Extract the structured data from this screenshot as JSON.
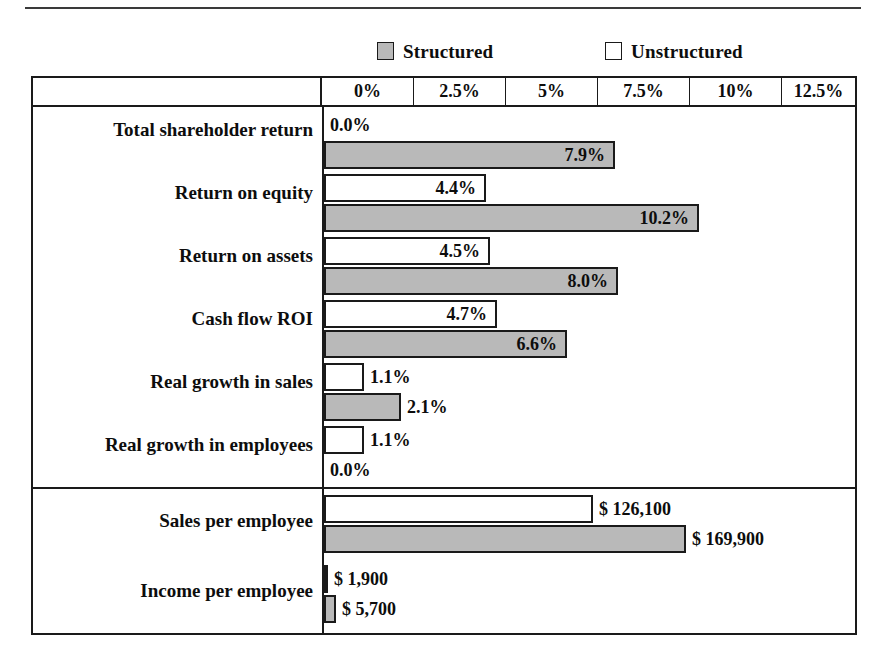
{
  "legend": {
    "items": [
      {
        "label": "Structured",
        "swatch": "gray-filled-square-icon",
        "color": "#b9b9b9"
      },
      {
        "label": "Unstructured",
        "swatch": "white-empty-square-icon",
        "color": "#ffffff"
      }
    ]
  },
  "axis": {
    "ticks": [
      "0%",
      "2.5%",
      "5%",
      "7.5%",
      "10%",
      "12.5%"
    ],
    "min": 0,
    "max": 12.5,
    "step": 2.5
  },
  "chart_data": {
    "type": "bar",
    "title": "",
    "subtitle": "",
    "xlabel": "",
    "ylabel": "",
    "orientation": "horizontal",
    "grid": false,
    "legend_position": "top",
    "series": [
      {
        "name": "Unstructured",
        "color": "#ffffff"
      },
      {
        "name": "Structured",
        "color": "#b9b9b9"
      }
    ],
    "panels": [
      {
        "name": "percent-metrics",
        "axis_ticks": [
          "0%",
          "2.5%",
          "5%",
          "7.5%",
          "10%",
          "12.5%"
        ],
        "xlim": [
          0,
          12.5
        ],
        "rows": [
          {
            "category": "Total shareholder return",
            "unstructured": {
              "value": 0.0,
              "label": "0.0%",
              "label_position": "no-bar"
            },
            "structured": {
              "value": 7.9,
              "label": "7.9%",
              "label_position": "inside"
            }
          },
          {
            "category": "Return on equity",
            "unstructured": {
              "value": 4.4,
              "label": "4.4%",
              "label_position": "inside"
            },
            "structured": {
              "value": 10.2,
              "label": "10.2%",
              "label_position": "inside"
            }
          },
          {
            "category": "Return on assets",
            "unstructured": {
              "value": 4.5,
              "label": "4.5%",
              "label_position": "inside"
            },
            "structured": {
              "value": 8.0,
              "label": "8.0%",
              "label_position": "inside"
            }
          },
          {
            "category": "Cash flow ROI",
            "unstructured": {
              "value": 4.7,
              "label": "4.7%",
              "label_position": "inside"
            },
            "structured": {
              "value": 6.6,
              "label": "6.6%",
              "label_position": "inside"
            }
          },
          {
            "category": "Real growth in sales",
            "unstructured": {
              "value": 1.1,
              "label": "1.1%",
              "label_position": "outside"
            },
            "structured": {
              "value": 2.1,
              "label": "2.1%",
              "label_position": "outside"
            }
          },
          {
            "category": "Real growth in employees",
            "unstructured": {
              "value": 1.1,
              "label": "1.1%",
              "label_position": "outside"
            },
            "structured": {
              "value": 0.0,
              "label": "0.0%",
              "label_position": "no-bar"
            }
          }
        ]
      },
      {
        "name": "per-employee-metrics",
        "xlim": [
          0,
          200000
        ],
        "rows": [
          {
            "category": "Sales per employee",
            "unstructured": {
              "value": 126100,
              "label": "$ 126,100",
              "label_position": "outside"
            },
            "structured": {
              "value": 169900,
              "label": "$ 169,900",
              "label_position": "outside"
            }
          },
          {
            "category": "Income per employee",
            "unstructured": {
              "value": 1900,
              "label": "$ 1,900",
              "label_position": "outside"
            },
            "structured": {
              "value": 5700,
              "label": "$ 5,700",
              "label_position": "outside"
            }
          }
        ]
      }
    ]
  }
}
